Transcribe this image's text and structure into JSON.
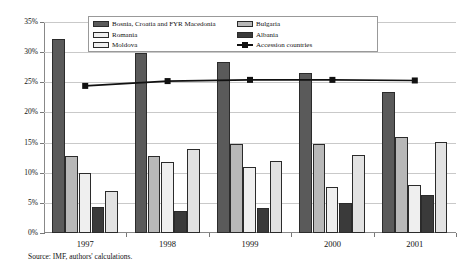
{
  "chart_data": {
    "type": "bar",
    "title": "",
    "subtitle": "",
    "xlabel": "",
    "ylabel": "",
    "categories": [
      "1997",
      "1998",
      "1999",
      "2000",
      "2001"
    ],
    "ylim": [
      0,
      35
    ],
    "ytick_labels": [
      "0%",
      "5%",
      "10%",
      "15%",
      "20%",
      "25%",
      "30%",
      "35%"
    ],
    "ytick_values": [
      0,
      5,
      10,
      15,
      20,
      25,
      30,
      35
    ],
    "grid": true,
    "legend_position": "top-center",
    "series": [
      {
        "name": "Bosnia, Croatia and FYR Macedonia",
        "type": "bar",
        "color": "#5a5a5a",
        "values": [
          32.1,
          29.8,
          28.3,
          26.6,
          23.4
        ]
      },
      {
        "name": "Romania",
        "type": "bar",
        "color": "#b8b8b8",
        "values": [
          12.7,
          12.8,
          14.8,
          14.8,
          16.0
        ]
      },
      {
        "name": "Moldova",
        "type": "bar",
        "color": "#efefef",
        "values": [
          10.0,
          11.8,
          11.0,
          7.6,
          8.0
        ]
      },
      {
        "name": "Bulgaria",
        "type": "bar",
        "color": "#3a3a3a",
        "values": [
          4.3,
          3.6,
          4.2,
          4.9,
          6.3
        ]
      },
      {
        "name": "Albania",
        "type": "bar",
        "color": "#e2e2e2",
        "values": [
          7.0,
          14.0,
          12.0,
          13.0,
          15.1
        ]
      },
      {
        "name": "Accession countries",
        "type": "line",
        "color": "#111111",
        "values": [
          24.4,
          25.2,
          25.4,
          25.4,
          25.3
        ]
      }
    ]
  },
  "legend": {
    "items": [
      {
        "label": "Bosnia, Croatia and FYR Macedonia",
        "swatch": "#5a5a5a",
        "kind": "bar"
      },
      {
        "label": "Romania",
        "swatch": "#efefef",
        "kind": "bar"
      },
      {
        "label": "Moldova",
        "swatch": "#efefef",
        "kind": "bar"
      },
      {
        "label": "Bulgaria",
        "swatch": "#b8b8b8",
        "kind": "bar"
      },
      {
        "label": "Albania",
        "swatch": "#3a3a3a",
        "kind": "bar"
      },
      {
        "label": "Accession countries",
        "swatch": "#111111",
        "kind": "line-marker"
      }
    ]
  },
  "footnote": {
    "source": "Source: IMF, authors' calculations."
  }
}
